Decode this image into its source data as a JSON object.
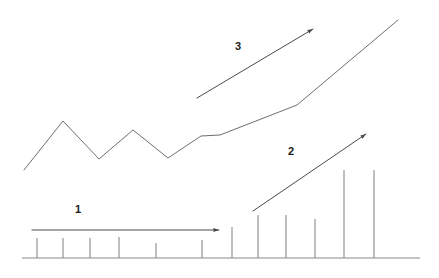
{
  "figure": {
    "background_color": "#ffffff",
    "width": 439,
    "height": 278,
    "stroke_color": "#6e6e6e",
    "bar_color": "#8a8a8a",
    "axis_color": "#8a8a8a",
    "arrow_color": "#4a4a4a",
    "label_color": "#1c1c1c"
  },
  "labels": {
    "phase1": "1",
    "phase2": "2",
    "phase3": "3"
  },
  "chart_data": {
    "type": "bar",
    "xlabel": "",
    "ylabel": "",
    "grid": false,
    "legend": false,
    "axis": {
      "baseline_y": 258,
      "x_start": 22,
      "x_end": 420,
      "xlim": [
        22,
        420
      ],
      "ylim": [
        0,
        258
      ]
    },
    "categories": [
      "1",
      "2",
      "3",
      "4",
      "5",
      "6",
      "7",
      "8",
      "9",
      "10",
      "11",
      "12",
      "13"
    ],
    "values": [
      20,
      20,
      20,
      21,
      15,
      18,
      31,
      43,
      43,
      39,
      88,
      88,
      0
    ],
    "bars": [
      {
        "category": "1",
        "x": 37,
        "top_y": 238,
        "height": 20
      },
      {
        "category": "2",
        "x": 63,
        "top_y": 238,
        "height": 20
      },
      {
        "category": "3",
        "x": 90,
        "top_y": 238,
        "height": 20
      },
      {
        "category": "4",
        "x": 119,
        "top_y": 237,
        "height": 21
      },
      {
        "category": "5",
        "x": 156,
        "top_y": 243,
        "height": 15
      },
      {
        "category": "6",
        "x": 202,
        "top_y": 240,
        "height": 18
      },
      {
        "category": "7",
        "x": 232,
        "top_y": 227,
        "height": 31
      },
      {
        "category": "8",
        "x": 258,
        "top_y": 215,
        "height": 43
      },
      {
        "category": "9",
        "x": 286,
        "top_y": 215,
        "height": 43
      },
      {
        "category": "10",
        "x": 315,
        "top_y": 219,
        "height": 39
      },
      {
        "category": "11",
        "x": 344,
        "top_y": 170,
        "height": 88
      },
      {
        "category": "12",
        "x": 374,
        "top_y": 170,
        "height": 88
      }
    ],
    "series": [
      {
        "name": "trend-line",
        "type": "line",
        "points": [
          {
            "x": 24,
            "y": 170
          },
          {
            "x": 63,
            "y": 121
          },
          {
            "x": 99,
            "y": 159
          },
          {
            "x": 133,
            "y": 130
          },
          {
            "x": 168,
            "y": 158
          },
          {
            "x": 201,
            "y": 136
          },
          {
            "x": 220,
            "y": 135
          },
          {
            "x": 297,
            "y": 105
          },
          {
            "x": 398,
            "y": 20
          }
        ]
      }
    ],
    "annotations": [
      {
        "label": "1",
        "kind": "arrow",
        "from": {
          "x": 32,
          "y": 230
        },
        "to": {
          "x": 219,
          "y": 230
        },
        "label_position": {
          "x": 78,
          "y": 210
        },
        "direction": "horizontal"
      },
      {
        "label": "2",
        "kind": "arrow",
        "from": {
          "x": 253,
          "y": 211
        },
        "to": {
          "x": 366,
          "y": 134
        },
        "label_position": {
          "x": 291,
          "y": 152
        },
        "direction": "up-right"
      },
      {
        "label": "3",
        "kind": "arrow",
        "from": {
          "x": 197,
          "y": 98
        },
        "to": {
          "x": 313,
          "y": 29
        },
        "label_position": {
          "x": 238,
          "y": 47
        },
        "direction": "up-right"
      }
    ]
  }
}
